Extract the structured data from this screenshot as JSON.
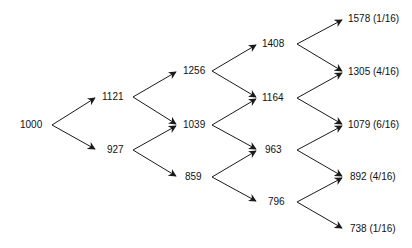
{
  "diagram": {
    "type": "binomial-tree",
    "colors": {
      "line": "#1a1a1a",
      "text": "#111111",
      "background": "#ffffff"
    },
    "levels": [
      {
        "step": 0,
        "nodes": [
          {
            "label": "1000",
            "x": 20,
            "y": 125
          }
        ]
      },
      {
        "step": 1,
        "nodes": [
          {
            "label": "1121",
            "x": 102,
            "y": 97
          },
          {
            "label": "927",
            "x": 107,
            "y": 150
          }
        ]
      },
      {
        "step": 2,
        "nodes": [
          {
            "label": "1256",
            "x": 183,
            "y": 71
          },
          {
            "label": "1039",
            "x": 183,
            "y": 125
          },
          {
            "label": "859",
            "x": 185,
            "y": 177
          }
        ]
      },
      {
        "step": 3,
        "nodes": [
          {
            "label": "1408",
            "x": 262,
            "y": 44
          },
          {
            "label": "1164",
            "x": 262,
            "y": 98
          },
          {
            "label": "963",
            "x": 265,
            "y": 150
          },
          {
            "label": "796",
            "x": 268,
            "y": 202
          }
        ]
      },
      {
        "step": 4,
        "nodes": [
          {
            "label": "1578 (1/16)",
            "x": 348,
            "y": 19
          },
          {
            "label": "1305 (4/16)",
            "x": 348,
            "y": 72
          },
          {
            "label": "1079 (6/16)",
            "x": 348,
            "y": 125
          },
          {
            "label": "892 (4/16)",
            "x": 350,
            "y": 177
          },
          {
            "label": "738 (1/16)",
            "x": 350,
            "y": 229
          }
        ]
      }
    ],
    "branch_origins_x": [
      52,
      133,
      212,
      297
    ],
    "branch_tips_x": [
      95,
      176,
      256,
      342
    ]
  }
}
